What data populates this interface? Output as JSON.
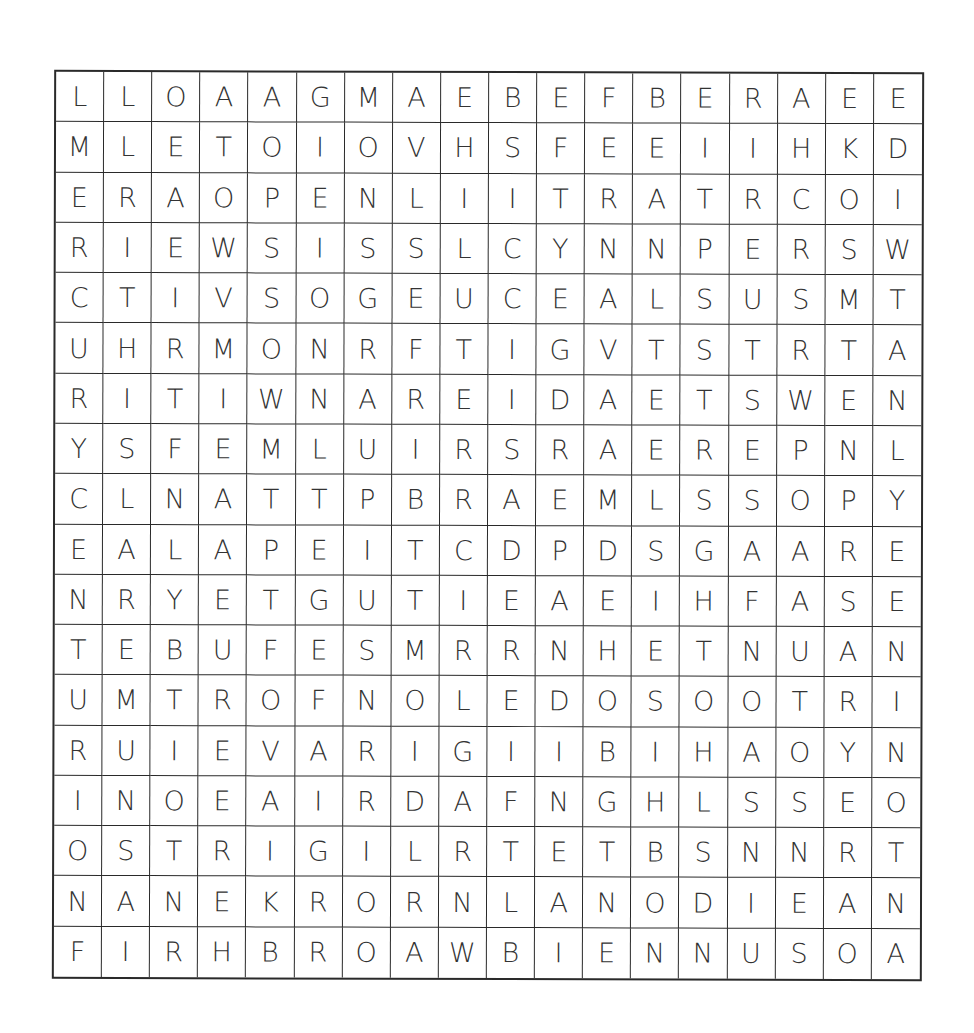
{
  "puzzle": {
    "rows": 18,
    "cols": 18,
    "grid": [
      [
        "L",
        "L",
        "O",
        "A",
        "A",
        "G",
        "M",
        "A",
        "E",
        "B",
        "E",
        "F",
        "B",
        "E",
        "R",
        "A",
        "E",
        "E"
      ],
      [
        "M",
        "L",
        "E",
        "T",
        "O",
        "I",
        "O",
        "V",
        "H",
        "S",
        "F",
        "E",
        "E",
        "I",
        "I",
        "H",
        "K",
        "D"
      ],
      [
        "E",
        "R",
        "A",
        "O",
        "P",
        "E",
        "N",
        "L",
        "I",
        "I",
        "T",
        "R",
        "A",
        "T",
        "R",
        "C",
        "O",
        "I"
      ],
      [
        "R",
        "I",
        "E",
        "W",
        "S",
        "I",
        "S",
        "S",
        "L",
        "C",
        "Y",
        "N",
        "N",
        "P",
        "E",
        "R",
        "S",
        "W"
      ],
      [
        "C",
        "T",
        "I",
        "V",
        "S",
        "O",
        "G",
        "E",
        "U",
        "C",
        "E",
        "A",
        "L",
        "S",
        "U",
        "S",
        "M",
        "T"
      ],
      [
        "U",
        "H",
        "R",
        "M",
        "O",
        "N",
        "R",
        "F",
        "T",
        "I",
        "G",
        "V",
        "T",
        "S",
        "T",
        "R",
        "T",
        "A"
      ],
      [
        "R",
        "I",
        "T",
        "I",
        "W",
        "N",
        "A",
        "R",
        "E",
        "I",
        "D",
        "A",
        "E",
        "T",
        "S",
        "W",
        "E",
        "N"
      ],
      [
        "Y",
        "S",
        "F",
        "E",
        "M",
        "L",
        "U",
        "I",
        "R",
        "S",
        "R",
        "A",
        "E",
        "R",
        "E",
        "P",
        "N",
        "L"
      ],
      [
        "C",
        "L",
        "N",
        "A",
        "T",
        "T",
        "P",
        "B",
        "R",
        "A",
        "E",
        "M",
        "L",
        "S",
        "S",
        "O",
        "P",
        "Y"
      ],
      [
        "E",
        "A",
        "L",
        "A",
        "P",
        "E",
        "I",
        "T",
        "C",
        "D",
        "P",
        "D",
        "S",
        "G",
        "A",
        "A",
        "R",
        "E"
      ],
      [
        "N",
        "R",
        "Y",
        "E",
        "T",
        "G",
        "U",
        "T",
        "I",
        "E",
        "A",
        "E",
        "I",
        "H",
        "F",
        "A",
        "S",
        "E"
      ],
      [
        "T",
        "E",
        "B",
        "U",
        "F",
        "E",
        "S",
        "M",
        "R",
        "R",
        "N",
        "H",
        "E",
        "T",
        "N",
        "U",
        "A",
        "N"
      ],
      [
        "U",
        "M",
        "T",
        "R",
        "O",
        "F",
        "N",
        "O",
        "L",
        "E",
        "D",
        "O",
        "S",
        "O",
        "O",
        "T",
        "R",
        "I"
      ],
      [
        "R",
        "U",
        "I",
        "E",
        "V",
        "A",
        "R",
        "I",
        "G",
        "I",
        "I",
        "B",
        "I",
        "H",
        "A",
        "O",
        "Y",
        "N"
      ],
      [
        "I",
        "N",
        "O",
        "E",
        "A",
        "I",
        "R",
        "D",
        "A",
        "F",
        "N",
        "G",
        "H",
        "L",
        "S",
        "S",
        "E",
        "O"
      ],
      [
        "O",
        "S",
        "T",
        "R",
        "I",
        "G",
        "I",
        "L",
        "R",
        "T",
        "E",
        "T",
        "B",
        "S",
        "N",
        "N",
        "R",
        "T"
      ],
      [
        "N",
        "A",
        "N",
        "E",
        "K",
        "R",
        "O",
        "R",
        "N",
        "L",
        "A",
        "N",
        "O",
        "D",
        "I",
        "E",
        "A",
        "N"
      ],
      [
        "F",
        "I",
        "R",
        "H",
        "B",
        "R",
        "O",
        "A",
        "W",
        "B",
        "I",
        "E",
        "N",
        "N",
        "U",
        "S",
        "O",
        "A"
      ]
    ]
  },
  "colors": {
    "background": "#ffffff",
    "grid_line": "#2a2a2a",
    "letter": "#333333"
  }
}
